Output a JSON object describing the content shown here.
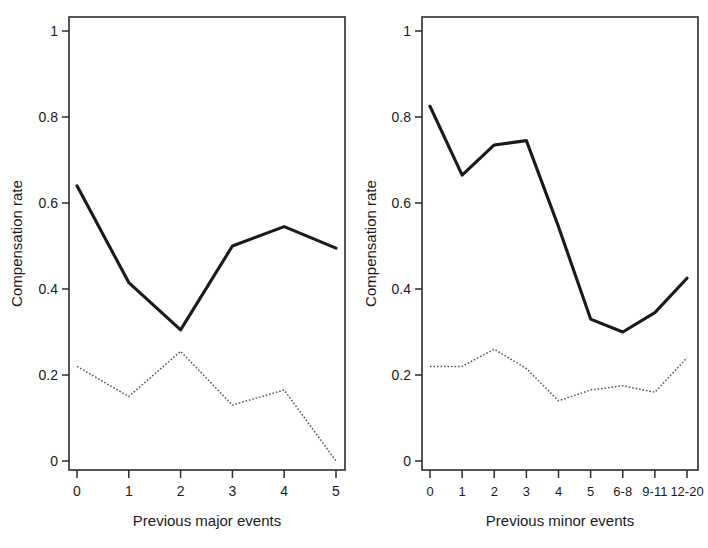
{
  "figure": {
    "background": "#ffffff",
    "panel_count": 2
  },
  "chart_data": [
    {
      "type": "line",
      "title": "",
      "panel": "left",
      "xlabel": "Previous major events",
      "ylabel": "Compensation rate",
      "categories": [
        "0",
        "1",
        "2",
        "3",
        "4",
        "5"
      ],
      "ylim": [
        0,
        1.05
      ],
      "yticks": [
        0,
        0.2,
        0.4,
        0.6,
        0.8,
        1
      ],
      "ytick_labels": [
        "0",
        "0.2",
        "0.4",
        "0.6",
        "0.8",
        "1"
      ],
      "grid": false,
      "legend": "none",
      "series": [
        {
          "name": "solid",
          "style": "solid",
          "color": "#1a1a1a",
          "values": [
            0.64,
            0.415,
            0.305,
            0.5,
            0.545,
            0.495
          ]
        },
        {
          "name": "dotted",
          "style": "dotted",
          "color": "#555555",
          "values": [
            0.22,
            0.15,
            0.255,
            0.13,
            0.165,
            0.0
          ]
        }
      ]
    },
    {
      "type": "line",
      "title": "",
      "panel": "right",
      "xlabel": "Previous minor events",
      "ylabel": "Compensation rate",
      "categories": [
        "0",
        "1",
        "2",
        "3",
        "4",
        "5",
        "6-8",
        "9-11",
        "12-20"
      ],
      "ylim": [
        0,
        1.05
      ],
      "yticks": [
        0,
        0.2,
        0.4,
        0.6,
        0.8,
        1
      ],
      "ytick_labels": [
        "0",
        "0.2",
        "0.4",
        "0.6",
        "0.8",
        "1"
      ],
      "grid": false,
      "legend": "none",
      "series": [
        {
          "name": "solid",
          "style": "solid",
          "color": "#1a1a1a",
          "values": [
            0.825,
            0.665,
            0.735,
            0.745,
            0.545,
            0.33,
            0.3,
            0.345,
            0.425
          ]
        },
        {
          "name": "dotted",
          "style": "dotted",
          "color": "#555555",
          "values": [
            0.22,
            0.22,
            0.26,
            0.215,
            0.14,
            0.165,
            0.175,
            0.16,
            0.24
          ]
        }
      ]
    }
  ]
}
